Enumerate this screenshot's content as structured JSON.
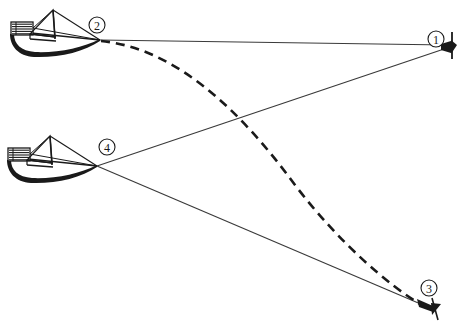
{
  "figure": {
    "kind": "nautical-navigation-diagram",
    "background_color": "#ffffff",
    "ink_color": "#1a1a1a",
    "line_color": "#3a3a3a",
    "width": 458,
    "height": 329
  },
  "markers": [
    {
      "id": "marker-1",
      "label": "1",
      "type": "buoy",
      "label_cx": 436,
      "label_cy": 39,
      "label_r": 8,
      "anchor_x": 447,
      "anchor_y": 47
    },
    {
      "id": "marker-2",
      "label": "2",
      "type": "boat-position",
      "label_cx": 97,
      "label_cy": 25,
      "label_r": 8,
      "anchor_x": 100,
      "anchor_y": 40
    },
    {
      "id": "marker-3",
      "label": "3",
      "type": "buoy",
      "label_cx": 429,
      "label_cy": 288,
      "label_r": 8,
      "anchor_x": 422,
      "anchor_y": 306
    },
    {
      "id": "marker-4",
      "label": "4",
      "type": "boat-position",
      "label_cx": 107,
      "label_cy": 147,
      "label_r": 8,
      "anchor_x": 97,
      "anchor_y": 166
    }
  ],
  "boats": [
    {
      "id": "boat-upper",
      "name": "sailboat-at-position-2",
      "origin_x": 8,
      "origin_y": 8,
      "bow_x": 100,
      "bow_y": 40
    },
    {
      "id": "boat-lower",
      "name": "sailboat-at-position-4",
      "origin_x": 5,
      "origin_y": 134,
      "bow_x": 97,
      "bow_y": 166
    }
  ],
  "sight_lines": [
    {
      "id": "line-2-to-1",
      "name": "bearing-line-from-2-to-1",
      "from": "2",
      "to": "1",
      "x1": 100,
      "y1": 40,
      "x2": 447,
      "y2": 45,
      "style": "solid"
    },
    {
      "id": "line-4-to-1",
      "name": "bearing-line-from-4-to-1",
      "from": "4",
      "to": "1",
      "x1": 97,
      "y1": 166,
      "x2": 447,
      "y2": 48,
      "style": "solid"
    },
    {
      "id": "line-4-to-3",
      "name": "bearing-line-from-4-to-3",
      "from": "4",
      "to": "3",
      "x1": 97,
      "y1": 166,
      "x2": 423,
      "y2": 305,
      "style": "solid"
    }
  ],
  "course_curve": {
    "id": "course-track",
    "name": "dashed-curved-course-from-2-to-3",
    "from": "2",
    "to": "3",
    "style": "dashed",
    "dash_pattern": "9 6",
    "path": "M 101 41 C 175 48 240 110 295 185 C 340 244 390 286 420 304",
    "stroke_width": 2.6
  }
}
